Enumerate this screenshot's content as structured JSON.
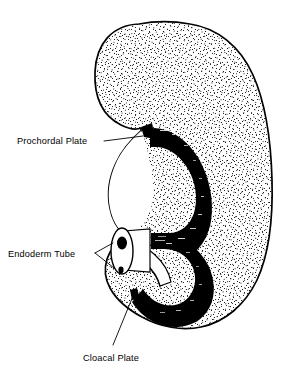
{
  "figure": {
    "background_color": "#ffffff",
    "ink_color": "#000000",
    "width": 285,
    "height": 371
  },
  "labels": [
    {
      "id": "prochordal-plate",
      "text": "Prochordal Plate",
      "x": 17,
      "y": 144,
      "anchor": "start",
      "leader_type": "straight"
    },
    {
      "id": "endoderm-tube",
      "text": "Endoderm Tube",
      "x": 8,
      "y": 256,
      "anchor": "start",
      "leader_type": "forked"
    },
    {
      "id": "cloacal-plate",
      "text": "Cloacal Plate",
      "x": 83,
      "y": 360,
      "anchor": "start",
      "leader_type": "diagonal"
    }
  ],
  "structures": {
    "body": {
      "name": "embryo-body",
      "texture": "stipple",
      "fill": "#ffffff",
      "stroke": "#000000"
    },
    "endoderm_band": {
      "name": "endoderm-tube-band",
      "fill": "#000000"
    },
    "tube_cross_section": {
      "name": "endoderm-tube-cross-section",
      "lumen_count": 2,
      "fill": "#ffffff",
      "stroke": "#000000"
    },
    "prochordal_marker": {
      "name": "prochordal-plate-marker",
      "fill": "#000000"
    },
    "cloacal_marker": {
      "name": "cloacal-plate-marker",
      "fill": "#000000"
    }
  }
}
